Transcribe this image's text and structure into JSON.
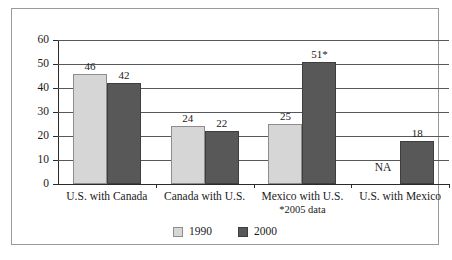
{
  "chart_data": {
    "type": "bar",
    "title": "",
    "subtitle": "",
    "xlabel": "",
    "ylabel": "",
    "ylim": [
      0,
      60
    ],
    "yticks": [
      0,
      10,
      20,
      30,
      40,
      50,
      60
    ],
    "ytick_labels": [
      "0",
      "10",
      "20",
      "30",
      "40",
      "50",
      "60"
    ],
    "grid": true,
    "legend_position": "bottom",
    "categories": [
      "U.S. with Canada",
      "Canada with U.S.",
      "Mexico with U.S.",
      "U.S. with Mexico"
    ],
    "category_notes": [
      "",
      "",
      "*2005 data",
      ""
    ],
    "series": [
      {
        "name": "1990",
        "color": "#d6d6d6",
        "values": [
          46,
          24,
          25,
          null
        ],
        "value_labels": [
          "46",
          "24",
          "25",
          "NA"
        ]
      },
      {
        "name": "2000",
        "color": "#585858",
        "values": [
          42,
          22,
          51,
          18
        ],
        "value_labels": [
          "42",
          "22",
          "51*",
          "18"
        ]
      }
    ],
    "annotations": [
      {
        "text": "NA",
        "category": "U.S. with Mexico",
        "series": "1990"
      },
      {
        "text": "*2005 data",
        "category": "Mexico with U.S."
      }
    ]
  },
  "legend": {
    "items": [
      {
        "label": "1990",
        "color": "#d6d6d6"
      },
      {
        "label": "2000",
        "color": "#585858"
      }
    ]
  },
  "colors": {
    "series_1990": "#d6d6d6",
    "series_2000": "#585858",
    "gridline": "#55595c",
    "axis": "#2b2b2b",
    "frame": "#9a9a9a",
    "background": "#ffffff",
    "text": "#1a1a1a"
  }
}
